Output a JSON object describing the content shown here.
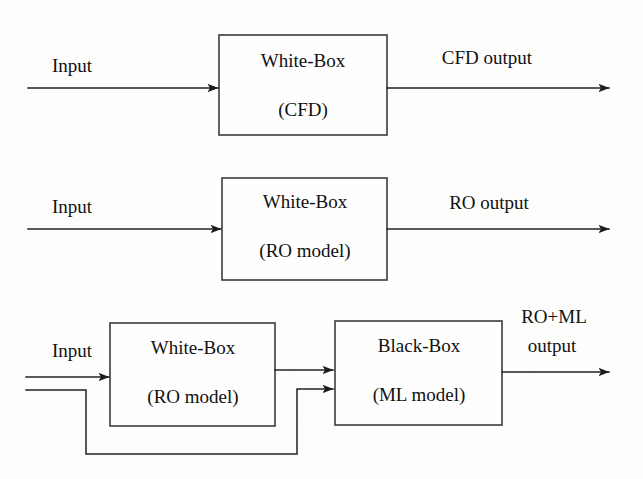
{
  "diagram": {
    "canvas": {
      "width": 643,
      "height": 479,
      "background": "#fdfdfc"
    },
    "stroke_color": "#222222",
    "box_fill": "#fefefe",
    "box_stroke": "#3b3b3b",
    "rows": [
      {
        "id": "row-cfd",
        "input_label": "Input",
        "box": {
          "title": "White-Box",
          "subtitle": "(CFD)"
        },
        "output_label": "CFD output"
      },
      {
        "id": "row-ro",
        "input_label": "Input",
        "box": {
          "title": "White-Box",
          "subtitle": "(RO model)"
        },
        "output_label": "RO output"
      },
      {
        "id": "row-ro-ml",
        "input_label": "Input",
        "box_white": {
          "title": "White-Box",
          "subtitle": "(RO model)"
        },
        "box_black": {
          "title": "Black-Box",
          "subtitle": "(ML model)"
        },
        "output_label_line1": "RO+ML",
        "output_label_line2": "output"
      }
    ]
  }
}
